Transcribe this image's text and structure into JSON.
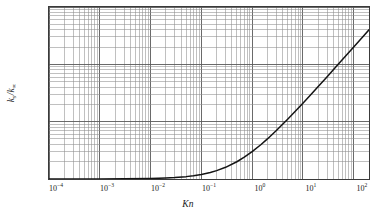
{
  "chart_data": {
    "type": "line",
    "title": "",
    "xlabel": "Kn",
    "ylabel": "k_s/k_inf",
    "xscale": "log",
    "yscale": "log",
    "xlim": [
      0.0001,
      200
    ],
    "ylim": [
      1,
      1000
    ],
    "grid": true,
    "grid_minor": true,
    "legend": "none",
    "relation": "ks/kinf = 1 + 2*Kn",
    "xticks": [
      0.0001,
      0.001,
      0.01,
      0.1,
      1,
      10,
      100
    ],
    "xtick_labels": [
      "10-4",
      "10-3",
      "10-2",
      "10-1",
      "100",
      "101",
      "102"
    ],
    "yticks": [
      1,
      10,
      100,
      1000
    ],
    "ytick_labels": [
      "1",
      "10",
      "100",
      "1000"
    ],
    "series": [
      {
        "name": "ks/kinf",
        "color": "#141414",
        "x": [
          0.0001,
          0.001,
          0.003,
          0.01,
          0.02,
          0.03,
          0.05,
          0.07,
          0.1,
          0.15,
          0.2,
          0.3,
          0.5,
          0.7,
          1.0,
          1.5,
          2.0,
          3.0,
          5.0,
          7.0,
          10.0,
          15.0,
          20.0,
          30.0,
          50.0,
          70.0,
          100.0,
          150.0,
          200.0
        ],
        "y": [
          1.0002,
          1.002,
          1.006,
          1.02,
          1.04,
          1.06,
          1.1,
          1.14,
          1.2,
          1.3,
          1.4,
          1.6,
          2.0,
          2.4,
          3.0,
          4.0,
          5.0,
          7.0,
          11.0,
          15.0,
          21.0,
          31.0,
          41.0,
          61.0,
          101.0,
          141.0,
          201.0,
          301.0,
          401.0
        ]
      }
    ]
  },
  "axes": {
    "x": {
      "label_k": "K",
      "label_n": "n",
      "ticks": [
        {
          "base": "10",
          "exp": "−4",
          "pos": 0.0001
        },
        {
          "base": "10",
          "exp": "−3",
          "pos": 0.001
        },
        {
          "base": "10",
          "exp": "−2",
          "pos": 0.01
        },
        {
          "base": "10",
          "exp": "−1",
          "pos": 0.1
        },
        {
          "base": "10",
          "exp": "0",
          "pos": 1
        },
        {
          "base": "10",
          "exp": "1",
          "pos": 10
        },
        {
          "base": "10",
          "exp": "2",
          "pos": 100
        }
      ]
    },
    "y": {
      "label_num": "k",
      "label_num_sub": "s",
      "label_slash": "/",
      "label_den": "k",
      "label_den_sub": "∞",
      "ticks": [
        {
          "text": "1000",
          "pos": 1000
        },
        {
          "text": "100",
          "pos": 100
        },
        {
          "text": "10",
          "pos": 10
        },
        {
          "text": "1",
          "pos": 1
        }
      ]
    }
  },
  "style": {
    "curve_color": "#141414",
    "grid_major_color": "#5a5a5a",
    "grid_minor_color": "#8c8c8c",
    "frame_color": "#3a3a3a",
    "text_color": "#1a1a1a",
    "background": "#ffffff"
  }
}
